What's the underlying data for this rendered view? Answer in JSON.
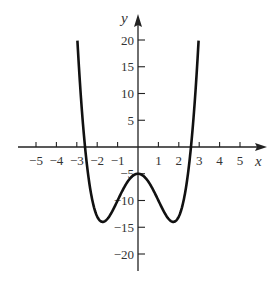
{
  "chart_data": {
    "type": "line",
    "title": "",
    "xlabel": "x",
    "ylabel": "y",
    "xlim": [
      -5.5,
      6
    ],
    "ylim": [
      -22,
      24
    ],
    "grid": false,
    "legend": null,
    "x_ticks": [
      -5,
      -4,
      -3,
      -2,
      -1,
      1,
      2,
      3,
      4,
      5
    ],
    "x_tick_labels": [
      "−5",
      "−4",
      "−3",
      "−2",
      "−1",
      "1",
      "2",
      "3",
      "4",
      "5"
    ],
    "y_ticks": [
      20,
      15,
      10,
      5,
      -5,
      -10,
      -15,
      -20
    ],
    "y_tick_labels": [
      "20",
      "15",
      "10",
      "5",
      "−5",
      "−10",
      "−15",
      "−20"
    ],
    "series": [
      {
        "name": "f(x)",
        "description": "Quartic W-shaped curve, approx f(x) = x^4 - 6x^2 - 5",
        "x": [
          -2.97,
          -2.6,
          -2.0,
          -1.73,
          -1.0,
          0,
          1.0,
          1.73,
          2.0,
          2.6,
          2.97
        ],
        "y": [
          20,
          0,
          -13,
          -14,
          -10,
          -5,
          -10,
          -14,
          -13,
          0,
          20
        ]
      }
    ],
    "key_points": {
      "y_intercept": [
        0,
        -5
      ],
      "local_minima": [
        [
          -1.73,
          -14
        ],
        [
          1.73,
          -14
        ]
      ],
      "local_maximum": [
        0,
        -5
      ],
      "x_intercepts": [
        -2.6,
        2.6
      ]
    }
  },
  "axes": {
    "x_label": "x",
    "y_label": "y"
  },
  "colors": {
    "curve": "#111111",
    "axis": "#222222",
    "text": "#333333",
    "background": "#ffffff"
  }
}
